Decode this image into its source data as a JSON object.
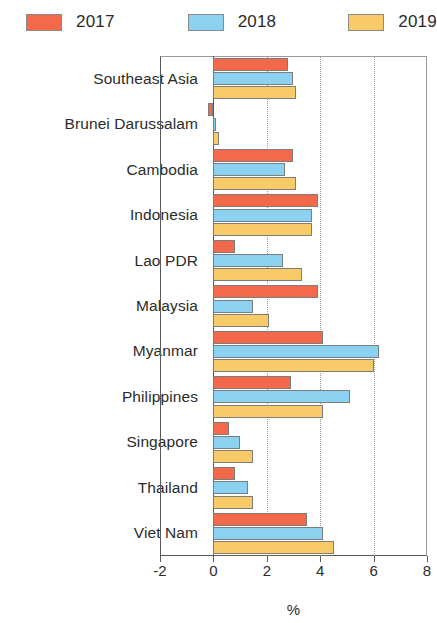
{
  "legend": {
    "items": [
      {
        "label": "2017",
        "color": "#f4694a"
      },
      {
        "label": "2018",
        "color": "#8ad2f0"
      },
      {
        "label": "2019",
        "color": "#f8cb68"
      }
    ]
  },
  "chart_data": {
    "type": "bar",
    "orientation": "horizontal",
    "title": "",
    "xlabel": "%",
    "ylabel": "",
    "xlim": [
      -2,
      8
    ],
    "xticks": [
      -2,
      0,
      2,
      4,
      6,
      8
    ],
    "xticklabels": [
      "-2",
      "0",
      "2",
      "4",
      "6",
      "8"
    ],
    "grid": "vertical-dotted",
    "legend_position": "top-left",
    "categories": [
      "Southeast Asia",
      "Brunei Darussalam",
      "Cambodia",
      "Indonesia",
      "Lao PDR",
      "Malaysia",
      "Myanmar",
      "Philippines",
      "Singapore",
      "Thailand",
      "Viet Nam"
    ],
    "series": [
      {
        "name": "2017",
        "color": "#f4694a",
        "values": [
          2.8,
          -0.2,
          3.0,
          3.9,
          0.8,
          3.9,
          4.1,
          2.9,
          0.6,
          0.8,
          3.5
        ]
      },
      {
        "name": "2018",
        "color": "#8ad2f0",
        "values": [
          3.0,
          0.1,
          2.7,
          3.7,
          2.6,
          1.5,
          6.2,
          5.1,
          1.0,
          1.3,
          4.1
        ]
      },
      {
        "name": "2019",
        "color": "#f8cb68",
        "values": [
          3.1,
          0.2,
          3.1,
          3.7,
          3.3,
          2.1,
          6.0,
          4.1,
          1.5,
          1.5,
          4.5
        ]
      }
    ]
  }
}
